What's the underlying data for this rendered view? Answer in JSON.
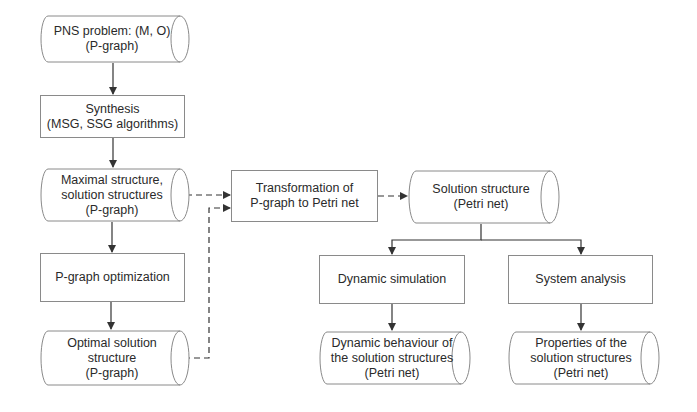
{
  "diagram": {
    "nodes": {
      "pns_problem": {
        "label": "PNS problem: (M, O)\n(P-graph)",
        "shape": "cylinder"
      },
      "synthesis": {
        "label": "Synthesis\n(MSG, SSG algorithms)",
        "shape": "rect"
      },
      "maximal_structure": {
        "label": "Maximal structure,\nsolution structures\n(P-graph)",
        "shape": "cylinder"
      },
      "pgraph_optimization": {
        "label": "P-graph optimization",
        "shape": "rect"
      },
      "optimal_solution": {
        "label": "Optimal solution\nstructure\n(P-graph)",
        "shape": "cylinder"
      },
      "transformation": {
        "label": "Transformation of\nP-graph to Petri net",
        "shape": "rect"
      },
      "solution_structure_petri": {
        "label": "Solution structure\n(Petri net)",
        "shape": "cylinder"
      },
      "dynamic_simulation": {
        "label": "Dynamic simulation",
        "shape": "rect"
      },
      "system_analysis": {
        "label": "System analysis",
        "shape": "rect"
      },
      "dynamic_behaviour": {
        "label": "Dynamic behaviour of\nthe solution structures\n(Petri net)",
        "shape": "cylinder"
      },
      "properties": {
        "label": "Properties of the\nsolution structures\n(Petri net)",
        "shape": "cylinder"
      }
    },
    "edges": [
      {
        "from": "pns_problem",
        "to": "synthesis",
        "style": "solid"
      },
      {
        "from": "synthesis",
        "to": "maximal_structure",
        "style": "solid"
      },
      {
        "from": "maximal_structure",
        "to": "pgraph_optimization",
        "style": "solid"
      },
      {
        "from": "pgraph_optimization",
        "to": "optimal_solution",
        "style": "solid"
      },
      {
        "from": "maximal_structure",
        "to": "transformation",
        "style": "dashed"
      },
      {
        "from": "optimal_solution",
        "to": "transformation",
        "style": "dashed"
      },
      {
        "from": "transformation",
        "to": "solution_structure_petri",
        "style": "dashed"
      },
      {
        "from": "solution_structure_petri",
        "to": "dynamic_simulation",
        "style": "solid"
      },
      {
        "from": "solution_structure_petri",
        "to": "system_analysis",
        "style": "solid"
      },
      {
        "from": "dynamic_simulation",
        "to": "dynamic_behaviour",
        "style": "solid"
      },
      {
        "from": "system_analysis",
        "to": "properties",
        "style": "solid"
      }
    ],
    "colors": {
      "line": "#333333",
      "border": "#8a8a8a",
      "background": "#ffffff"
    }
  }
}
